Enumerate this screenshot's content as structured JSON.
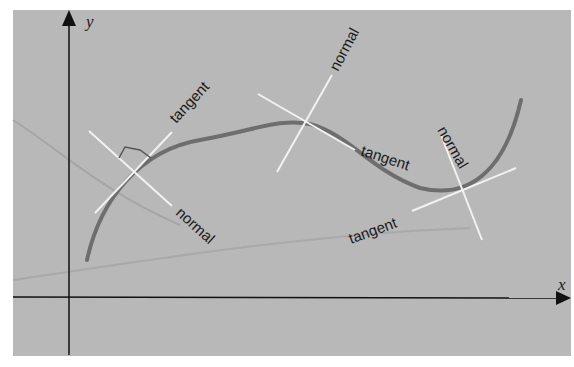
{
  "diagram": {
    "colors": {
      "panel": "#b8b8b8",
      "axis": "#111111",
      "curve": "#6e6e6e",
      "construction_lines": "#f2f2f2",
      "faint_curves": "#a4a4a4",
      "text": "#1a1a1a"
    },
    "axes": {
      "x_label": "x",
      "y_label": "y"
    },
    "points": [
      {
        "id": "p1",
        "tangent_label": "tangent",
        "normal_label": "normal",
        "right_angle_marker": true
      },
      {
        "id": "p2",
        "tangent_label": "tangent",
        "normal_label": "normal",
        "right_angle_marker": false
      },
      {
        "id": "p3",
        "tangent_label": "tangent",
        "normal_label": "normal",
        "right_angle_marker": false
      }
    ]
  }
}
